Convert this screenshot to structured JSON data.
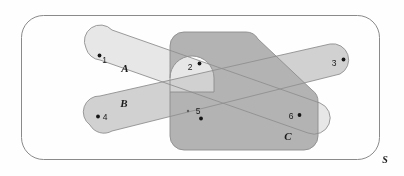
{
  "diagram": {
    "type": "venn-euler-diagram",
    "universal_set": {
      "label": "S",
      "label_position": "bottom-right-outside"
    },
    "sets": [
      {
        "id": "A",
        "label": "A",
        "shape": "capsule-band",
        "orientation": "upper-left-to-lower-right",
        "fill": "#e6e6e6"
      },
      {
        "id": "B",
        "label": "B",
        "shape": "capsule-band",
        "orientation": "lower-left-to-upper-right",
        "fill": "#c9c9c9"
      },
      {
        "id": "C",
        "label": "C",
        "shape": "rounded-polygon-with-notch",
        "fill": "#a8a8a8"
      }
    ],
    "points": [
      {
        "label": "1",
        "label_side": "right",
        "x": 104.5,
        "y": 58.5,
        "dot_x": 99.5,
        "dot_y": 55.5
      },
      {
        "label": "2",
        "label_side": "right",
        "x": 189.0,
        "y": 68.0,
        "dot_x": 199.5,
        "dot_y": 63.5
      },
      {
        "label": "3",
        "label_side": "right",
        "x": 334.0,
        "y": 64.0,
        "dot_x": 343.5,
        "dot_y": 59.5
      },
      {
        "label": "4",
        "label_side": "left",
        "x": 104.5,
        "y": 119.0,
        "dot_x": 98.0,
        "dot_y": 116.5
      },
      {
        "label": "5",
        "label_side": "right",
        "x": 197.0,
        "y": 112.0,
        "dot_x": 201.0,
        "dot_y": 118.5
      },
      {
        "label": "6",
        "label_side": "left",
        "x": 290.5,
        "y": 117.0,
        "dot_x": 299.5,
        "dot_y": 115.0
      }
    ],
    "colors": {
      "background": "#fefefe",
      "universe_border": "#8a8a8a",
      "set_a_fill": "#e6e6e6",
      "set_b_fill": "#c9c9c9",
      "set_c_fill": "#a8a8a8",
      "set_stroke": "#8a8a8a",
      "point_dot": "#151515",
      "text": "#1a1a1a"
    }
  }
}
